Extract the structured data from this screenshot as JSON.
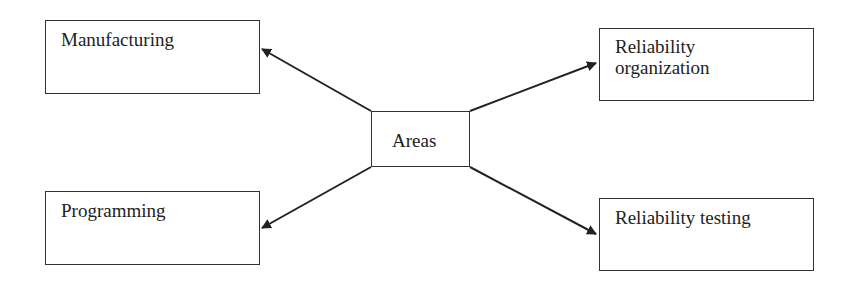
{
  "diagram": {
    "type": "hub-and-spoke",
    "center": {
      "label": "Areas"
    },
    "nodes": [
      {
        "id": "manufacturing",
        "label": "Manufacturing",
        "position": "top-left"
      },
      {
        "id": "programming",
        "label": "Programming",
        "position": "bottom-left"
      },
      {
        "id": "reliability_organization",
        "label_line1": "Reliability",
        "label_line2": "organization",
        "position": "top-right"
      },
      {
        "id": "reliability_testing",
        "label": "Reliability testing",
        "position": "bottom-right"
      }
    ],
    "edges": [
      {
        "from": "Areas",
        "to": "Manufacturing"
      },
      {
        "from": "Areas",
        "to": "Programming"
      },
      {
        "from": "Areas",
        "to": "Reliability organization"
      },
      {
        "from": "Areas",
        "to": "Reliability testing"
      }
    ],
    "colors": {
      "stroke": "#222222",
      "background": "#ffffff"
    }
  }
}
